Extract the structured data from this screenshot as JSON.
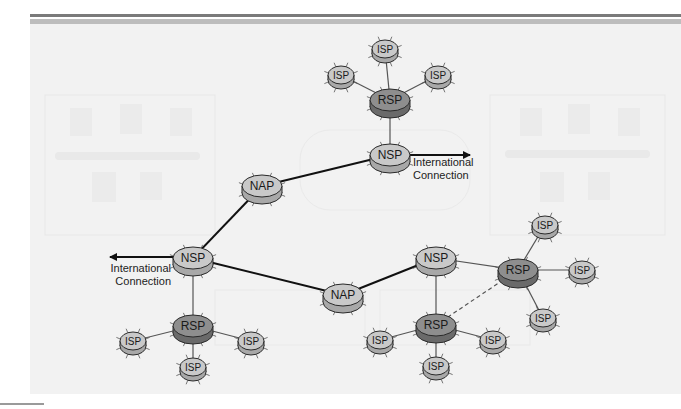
{
  "diagram": {
    "colors": {
      "panel_bg": "#f2f2f2",
      "node_light": "#c9c9c9",
      "node_dark": "#8e8e8e",
      "node_stroke": "#2a2a2a",
      "line": "#222222",
      "ghost": "#e3e3e3"
    },
    "labels": {
      "intl_top": [
        "International",
        "Connection"
      ],
      "intl_left": [
        "International",
        "Connection"
      ]
    },
    "nodes": [
      {
        "id": "isp_top_1",
        "label": "ISP",
        "type": "ISP",
        "x": 385,
        "y": 49
      },
      {
        "id": "isp_top_2",
        "label": "ISP",
        "type": "ISP",
        "x": 341,
        "y": 75
      },
      {
        "id": "isp_top_3",
        "label": "ISP",
        "type": "ISP",
        "x": 438,
        "y": 75
      },
      {
        "id": "rsp_top",
        "label": "RSP",
        "type": "RSP",
        "x": 390,
        "y": 100
      },
      {
        "id": "nsp_top",
        "label": "NSP",
        "type": "NSP",
        "x": 390,
        "y": 155
      },
      {
        "id": "nap_left",
        "label": "NAP",
        "type": "NAP",
        "x": 262,
        "y": 186
      },
      {
        "id": "nsp_left",
        "label": "NSP",
        "type": "NSP",
        "x": 193,
        "y": 258
      },
      {
        "id": "rsp_bl",
        "label": "RSP",
        "type": "RSP",
        "x": 193,
        "y": 326
      },
      {
        "id": "isp_bl_1",
        "label": "ISP",
        "type": "ISP",
        "x": 133,
        "y": 341
      },
      {
        "id": "isp_bl_2",
        "label": "ISP",
        "type": "ISP",
        "x": 251,
        "y": 341
      },
      {
        "id": "isp_bl_3",
        "label": "ISP",
        "type": "ISP",
        "x": 193,
        "y": 367
      },
      {
        "id": "nap_center",
        "label": "NAP",
        "type": "NAP",
        "x": 343,
        "y": 295
      },
      {
        "id": "nsp_right",
        "label": "NSP",
        "type": "NSP",
        "x": 436,
        "y": 258
      },
      {
        "id": "rsp_br",
        "label": "RSP",
        "type": "RSP",
        "x": 436,
        "y": 325
      },
      {
        "id": "isp_br_1",
        "label": "ISP",
        "type": "ISP",
        "x": 380,
        "y": 340
      },
      {
        "id": "isp_br_2",
        "label": "ISP",
        "type": "ISP",
        "x": 493,
        "y": 340
      },
      {
        "id": "isp_br_3",
        "label": "ISP",
        "type": "ISP",
        "x": 436,
        "y": 366
      },
      {
        "id": "rsp_right",
        "label": "RSP",
        "type": "RSP",
        "x": 518,
        "y": 270
      },
      {
        "id": "isp_r_1",
        "label": "ISP",
        "type": "ISP",
        "x": 545,
        "y": 225
      },
      {
        "id": "isp_r_2",
        "label": "ISP",
        "type": "ISP",
        "x": 582,
        "y": 270
      },
      {
        "id": "isp_r_3",
        "label": "ISP",
        "type": "ISP",
        "x": 543,
        "y": 318
      }
    ],
    "links": [
      {
        "from": "isp_top_1",
        "to": "rsp_top",
        "style": "thin"
      },
      {
        "from": "isp_top_2",
        "to": "rsp_top",
        "style": "thin"
      },
      {
        "from": "isp_top_3",
        "to": "rsp_top",
        "style": "thin"
      },
      {
        "from": "rsp_top",
        "to": "nsp_top",
        "style": "thin"
      },
      {
        "from": "nsp_top",
        "to": "nap_left",
        "style": "thick"
      },
      {
        "from": "nap_left",
        "to": "nsp_left",
        "style": "thick"
      },
      {
        "from": "nsp_left",
        "to": "nap_center",
        "style": "thick"
      },
      {
        "from": "nap_center",
        "to": "nsp_right",
        "style": "thick"
      },
      {
        "from": "nsp_left",
        "to": "rsp_bl",
        "style": "thin"
      },
      {
        "from": "rsp_bl",
        "to": "isp_bl_1",
        "style": "thin"
      },
      {
        "from": "rsp_bl",
        "to": "isp_bl_2",
        "style": "thin"
      },
      {
        "from": "rsp_bl",
        "to": "isp_bl_3",
        "style": "thin"
      },
      {
        "from": "nsp_right",
        "to": "rsp_br",
        "style": "thin"
      },
      {
        "from": "nsp_right",
        "to": "rsp_right",
        "style": "thin"
      },
      {
        "from": "rsp_br",
        "to": "rsp_right",
        "style": "dashed"
      },
      {
        "from": "rsp_br",
        "to": "isp_br_1",
        "style": "thin"
      },
      {
        "from": "rsp_br",
        "to": "isp_br_2",
        "style": "thin"
      },
      {
        "from": "rsp_br",
        "to": "isp_br_3",
        "style": "thin"
      },
      {
        "from": "rsp_right",
        "to": "isp_r_1",
        "style": "thin"
      },
      {
        "from": "rsp_right",
        "to": "isp_r_2",
        "style": "thin"
      },
      {
        "from": "rsp_right",
        "to": "isp_r_3",
        "style": "thin"
      }
    ],
    "arrows": [
      {
        "id": "intl_arrow_top",
        "x1": 410,
        "y1": 155,
        "x2": 470,
        "y2": 155,
        "label_key": "intl_top",
        "lx": 413,
        "ly": 166,
        "anchor": "start"
      },
      {
        "id": "intl_arrow_left",
        "x1": 173,
        "y1": 257,
        "x2": 110,
        "y2": 257,
        "label_key": "intl_left",
        "lx": 171,
        "ly": 272,
        "anchor": "end"
      }
    ]
  }
}
